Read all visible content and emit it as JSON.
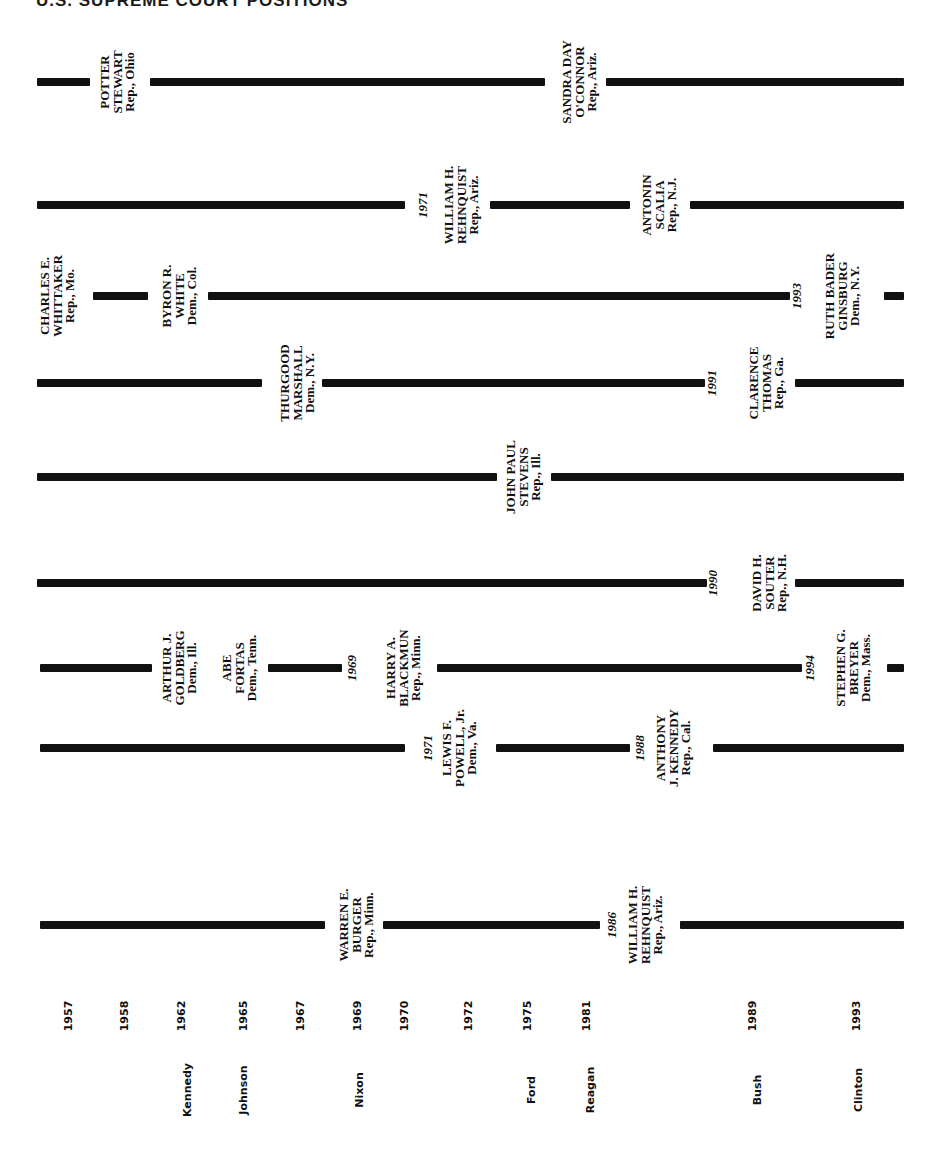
{
  "title": "U.S. SUPREME COURT POSITIONS",
  "chart_data": {
    "type": "timeline",
    "title": "U.S. SUPREME COURT POSITIONS",
    "seats": [
      {
        "y": 82,
        "segments": [
          [
            37,
            90
          ],
          [
            150,
            545
          ],
          [
            606,
            904
          ]
        ],
        "labels": [
          {
            "x": 118,
            "text": "POTTER\nSTEWART\nRep., Ohio",
            "kind": "name"
          },
          {
            "x": 580,
            "text": "SANDRA DAY\nO'CONNOR\nRep., Ariz.",
            "kind": "name"
          }
        ]
      },
      {
        "y": 205,
        "segments": [
          [
            37,
            405
          ],
          [
            490,
            630
          ],
          [
            690,
            904
          ]
        ],
        "labels": [
          {
            "x": 423,
            "text": "1971",
            "kind": "year"
          },
          {
            "x": 462,
            "text": "WILLIAM H.\nREHNQUIST\nRep., Ariz.",
            "kind": "name"
          },
          {
            "x": 660,
            "text": "ANTONIN\nSCALIA\nRep., N.J.",
            "kind": "name"
          }
        ]
      },
      {
        "y": 296,
        "segments": [
          [
            93,
            148
          ],
          [
            208,
            790
          ],
          [
            884,
            904
          ]
        ],
        "labels": [
          {
            "x": 58,
            "text": "CHARLES E.\nWHITTAKER\nRep., Mo.",
            "kind": "name"
          },
          {
            "x": 180,
            "text": "BYRON R.\nWHITE\nDem., Col.",
            "kind": "name"
          },
          {
            "x": 797,
            "text": "1993",
            "kind": "year"
          },
          {
            "x": 843,
            "text": "RUTH BADER\nGINSBURG\nDem., N.Y.",
            "kind": "name"
          }
        ]
      },
      {
        "y": 383,
        "segments": [
          [
            37,
            262
          ],
          [
            322,
            705
          ],
          [
            795,
            904
          ]
        ],
        "labels": [
          {
            "x": 298,
            "text": "THURGOOD\nMARSHALL\nDem., N.Y.",
            "kind": "name"
          },
          {
            "x": 712,
            "text": "1991",
            "kind": "year"
          },
          {
            "x": 767,
            "text": "CLARENCE\nTHOMAS\nRep., Ga.",
            "kind": "name"
          }
        ]
      },
      {
        "y": 477,
        "segments": [
          [
            37,
            497
          ],
          [
            551,
            904
          ]
        ],
        "labels": [
          {
            "x": 524,
            "text": "JOHN PAUL\nSTEVENS\nRep., Ill.",
            "kind": "name"
          }
        ]
      },
      {
        "y": 583,
        "segments": [
          [
            37,
            707
          ],
          [
            795,
            904
          ]
        ],
        "labels": [
          {
            "x": 713,
            "text": "1990",
            "kind": "year"
          },
          {
            "x": 770,
            "text": "DAVID H.\nSOUTER\nRep., N.H.",
            "kind": "name"
          }
        ]
      },
      {
        "y": 668,
        "segments": [
          [
            40,
            152
          ],
          [
            268,
            342
          ],
          [
            437,
            802
          ],
          [
            887,
            904
          ]
        ],
        "labels": [
          {
            "x": 180,
            "text": "ARTHUR J.\nGOLDBERG\nDem., Ill.",
            "kind": "name"
          },
          {
            "x": 240,
            "text": "ABE\nFORTAS\nDem., Tenn.",
            "kind": "name"
          },
          {
            "x": 352,
            "text": "1969",
            "kind": "year"
          },
          {
            "x": 404,
            "text": "HARRY A.\nBLACKMUN\nRep., Minn.",
            "kind": "name"
          },
          {
            "x": 810,
            "text": "1994",
            "kind": "year"
          },
          {
            "x": 854,
            "text": "STEPHEN G.\nBREYER\nDem., Mass.",
            "kind": "name"
          }
        ]
      },
      {
        "y": 748,
        "segments": [
          [
            40,
            405
          ],
          [
            496,
            630
          ],
          [
            713,
            904
          ]
        ],
        "labels": [
          {
            "x": 428,
            "text": "1971",
            "kind": "year"
          },
          {
            "x": 460,
            "text": "LEWIS F.\nPOWELL, Jr.\nDem., Va.",
            "kind": "name"
          },
          {
            "x": 640,
            "text": "1988",
            "kind": "year"
          },
          {
            "x": 674,
            "text": "ANTHONY\nJ. KENNEDY\nRep., Cal.",
            "kind": "name"
          }
        ]
      },
      {
        "y": 925,
        "segments": [
          [
            40,
            325
          ],
          [
            383,
            600
          ],
          [
            680,
            904
          ]
        ],
        "labels": [
          {
            "x": 357,
            "text": "WARREN E.\nBURGER\nRep., Minn.",
            "kind": "name"
          },
          {
            "x": 612,
            "text": "1986",
            "kind": "year"
          },
          {
            "x": 646,
            "text": "WILLIAM H.\nREHNQUIST\nRep., Ariz.",
            "kind": "name"
          }
        ]
      }
    ],
    "year_axis": {
      "y": 1016,
      "ticks": [
        {
          "x": 68,
          "label": "1957"
        },
        {
          "x": 124,
          "label": "1958"
        },
        {
          "x": 181,
          "label": "1962"
        },
        {
          "x": 243,
          "label": "1965"
        },
        {
          "x": 300,
          "label": "1967"
        },
        {
          "x": 357,
          "label": "1969"
        },
        {
          "x": 404,
          "label": "1970"
        },
        {
          "x": 468,
          "label": "1972"
        },
        {
          "x": 527,
          "label": "1975"
        },
        {
          "x": 586,
          "label": "1981"
        },
        {
          "x": 752,
          "label": "1989"
        },
        {
          "x": 856,
          "label": "1993"
        }
      ]
    },
    "president_axis": {
      "y": 1090,
      "labels": [
        {
          "x": 187,
          "label": "Kennedy"
        },
        {
          "x": 243,
          "label": "Johnson"
        },
        {
          "x": 359,
          "label": "Nixon"
        },
        {
          "x": 531,
          "label": "Ford"
        },
        {
          "x": 590,
          "label": "Reagan"
        },
        {
          "x": 757,
          "label": "Bush"
        },
        {
          "x": 858,
          "label": "Clinton"
        }
      ]
    }
  }
}
